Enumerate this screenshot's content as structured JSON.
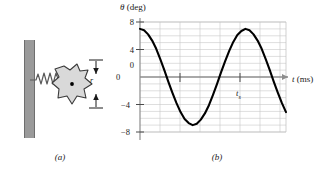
{
  "figure": {
    "caption_a": "(a)",
    "caption_b": "(b)"
  },
  "panel_a": {
    "name": "spring-mass-oscillator-diagram",
    "wall_label": "wall",
    "spring_label": "spring",
    "body_label": "irregular-rigid-body",
    "center_dot_label": "center-of-mass-dot",
    "dimension_label": "r",
    "colors": {
      "wall_fill": "#9a9a9a",
      "wall_stroke": "#6e6e6e",
      "body_fill": "#d9d9d9",
      "body_stroke": "#3a3a3a",
      "spring_stroke": "#5a5a5a",
      "dot_fill": "#000000"
    }
  },
  "panel_b": {
    "ylabel_symbol": "θ",
    "ylabel_units": " (deg)",
    "xlabel_symbol": "t",
    "xlabel_units": " (ms)",
    "origin_label": "0",
    "xtick_label_symbol": "t",
    "xtick_label_subscript": "s",
    "ytick_labels": [
      "8",
      "4",
      "0",
      "−4",
      "−8"
    ],
    "colors": {
      "curve": "#000000",
      "axis": "#8d8d8d",
      "grid": "#c8c8c8",
      "text": "#1a1a1a"
    }
  },
  "chart_data": {
    "type": "line",
    "title": "",
    "xlabel": "t (ms)",
    "ylabel": "θ (deg)",
    "xlim": [
      0,
      7.2
    ],
    "ylim": [
      -8,
      8
    ],
    "grid": true,
    "grid_y_step": 1,
    "grid_x_step": 1,
    "ytick_values": [
      8,
      4,
      0,
      -4,
      -8
    ],
    "xtick_values": [
      0,
      4
    ],
    "xtick_display": [
      "0",
      "t_s"
    ],
    "legend": "none",
    "amplitude": 7,
    "period": 5.2,
    "form": "theta = A*cos(2*pi*t/T)",
    "series": [
      {
        "name": "theta(t)",
        "x": [
          0.0,
          0.2,
          0.4,
          0.6,
          0.8,
          1.0,
          1.2,
          1.4,
          1.6,
          1.8,
          2.0,
          2.2,
          2.4,
          2.6,
          2.8,
          3.0,
          3.2,
          3.4,
          3.6,
          3.8,
          4.0,
          4.2,
          4.4,
          4.6,
          4.8,
          5.0,
          5.2,
          5.4,
          5.6,
          5.8,
          6.0,
          6.2,
          6.4,
          6.6,
          6.8,
          7.0,
          7.2
        ],
        "y": [
          7.0,
          6.8,
          6.2,
          5.3,
          4.1,
          2.6,
          1.0,
          -0.7,
          -2.3,
          -3.8,
          -5.1,
          -6.1,
          -6.7,
          -7.0,
          -6.8,
          -6.2,
          -5.3,
          -4.1,
          -2.6,
          -1.0,
          0.7,
          2.3,
          3.8,
          5.1,
          6.1,
          6.7,
          7.0,
          6.8,
          6.2,
          5.3,
          4.1,
          2.6,
          1.0,
          -0.7,
          -2.3,
          -3.8,
          -5.1
        ]
      }
    ]
  }
}
